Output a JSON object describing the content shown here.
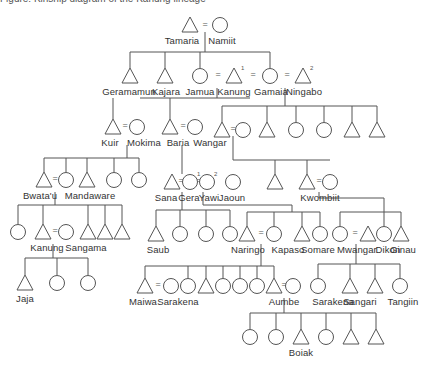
{
  "caption": "Figure: Kinship diagram of the Kanung lineage",
  "legend": {
    "male": "triangle",
    "female": "circle",
    "marriage": "="
  },
  "people": [
    {
      "id": "tamaria",
      "label": "Tamaria",
      "sex": "m",
      "x": 190,
      "y": 25,
      "lx": 182
    },
    {
      "id": "namiit",
      "label": "Namiit",
      "sex": "f",
      "x": 220,
      "y": 25,
      "lx": 222
    },
    {
      "id": "geramamun",
      "label": "Geramamun",
      "sex": "m",
      "x": 130,
      "y": 76,
      "lx": 129
    },
    {
      "id": "kajara",
      "label": "Kajara",
      "sex": "m",
      "x": 165,
      "y": 76,
      "lx": 166
    },
    {
      "id": "jamua",
      "label": "Jamua",
      "sex": "f",
      "x": 200,
      "y": 76,
      "lx": 200
    },
    {
      "id": "kanung",
      "label": "Kanung",
      "sex": "m",
      "x": 234,
      "y": 76,
      "lx": 234,
      "sup": "1"
    },
    {
      "id": "gamaia",
      "label": "Gamaia",
      "sex": "f",
      "x": 270,
      "y": 76,
      "lx": 271
    },
    {
      "id": "ningabo",
      "label": "Ningabo",
      "sex": "m",
      "x": 303,
      "y": 76,
      "lx": 304,
      "sup": "2"
    },
    {
      "id": "kuir",
      "label": "Kuir",
      "sex": "m",
      "x": 113,
      "y": 127,
      "lx": 110
    },
    {
      "id": "mokima",
      "label": "Mokima",
      "sex": "f",
      "x": 137,
      "y": 127,
      "lx": 144
    },
    {
      "id": "baria",
      "label": "Baria",
      "sex": "m",
      "x": 170,
      "y": 127,
      "lx": 178
    },
    {
      "id": "wangar",
      "label": "Wangar",
      "sex": "f",
      "x": 195,
      "y": 127,
      "lx": 210
    },
    {
      "id": "g2a",
      "label": "",
      "sex": "m",
      "x": 222,
      "y": 130
    },
    {
      "id": "g2b",
      "label": "",
      "sex": "f",
      "x": 243,
      "y": 130
    },
    {
      "id": "g2c",
      "label": "",
      "sex": "m",
      "x": 267,
      "y": 130
    },
    {
      "id": "g2d",
      "label": "",
      "sex": "f",
      "x": 296,
      "y": 130
    },
    {
      "id": "g2e",
      "label": "",
      "sex": "f",
      "x": 324,
      "y": 130
    },
    {
      "id": "g2f",
      "label": "",
      "sex": "m",
      "x": 352,
      "y": 130
    },
    {
      "id": "g2g",
      "label": "",
      "sex": "m",
      "x": 377,
      "y": 130
    },
    {
      "id": "bwatau",
      "label": "Bwata'u",
      "sex": "m",
      "x": 44,
      "y": 180,
      "lx": 40
    },
    {
      "id": "mandaware",
      "label": "Mandaware",
      "sex": "f",
      "x": 66,
      "y": 180,
      "lx": 90
    },
    {
      "id": "g3c",
      "label": "",
      "sex": "m",
      "x": 87,
      "y": 180
    },
    {
      "id": "g3d",
      "label": "",
      "sex": "f",
      "x": 114,
      "y": 180
    },
    {
      "id": "g3e",
      "label": "",
      "sex": "f",
      "x": 139,
      "y": 180
    },
    {
      "id": "sana",
      "label": "Sana",
      "sex": "m",
      "x": 172,
      "y": 182,
      "lx": 166
    },
    {
      "id": "gera",
      "label": "Gera",
      "sex": "f",
      "x": 190,
      "y": 182,
      "lx": 189,
      "sup": "1"
    },
    {
      "id": "yawi",
      "label": "Yawi",
      "sex": "f",
      "x": 207,
      "y": 182,
      "lx": 209,
      "sup": "2"
    },
    {
      "id": "jaoun",
      "label": "Jaoun",
      "sex": "f",
      "x": 233,
      "y": 182,
      "lx": 232
    },
    {
      "id": "g3j",
      "label": "",
      "sex": "m",
      "x": 275,
      "y": 182
    },
    {
      "id": "kwombiit",
      "label": "Kwombiit",
      "sex": "m",
      "x": 307,
      "y": 182,
      "lx": 320
    },
    {
      "id": "g3l",
      "label": "",
      "sex": "f",
      "x": 330,
      "y": 182
    },
    {
      "id": "g4a",
      "label": "",
      "sex": "f",
      "x": 18,
      "y": 232
    },
    {
      "id": "kanung2",
      "label": "Kanung",
      "sex": "m",
      "x": 43,
      "y": 232,
      "lx": 47
    },
    {
      "id": "sangama",
      "label": "Sangama",
      "sex": "f",
      "x": 66,
      "y": 232,
      "lx": 86
    },
    {
      "id": "g4d",
      "label": "",
      "sex": "m",
      "x": 88,
      "y": 232
    },
    {
      "id": "g4e",
      "label": "",
      "sex": "m",
      "x": 105,
      "y": 232
    },
    {
      "id": "g4f",
      "label": "",
      "sex": "m",
      "x": 122,
      "y": 232
    },
    {
      "id": "saub",
      "label": "Saub",
      "sex": "m",
      "x": 156,
      "y": 234,
      "lx": 158
    },
    {
      "id": "g4h",
      "label": "",
      "sex": "f",
      "x": 180,
      "y": 234
    },
    {
      "id": "g4i",
      "label": "",
      "sex": "f",
      "x": 206,
      "y": 234
    },
    {
      "id": "g4j",
      "label": "",
      "sex": "f",
      "x": 230,
      "y": 234
    },
    {
      "id": "naringo",
      "label": "Naringo",
      "sex": "m",
      "x": 247,
      "y": 234,
      "lx": 248
    },
    {
      "id": "kapaso",
      "label": "Kapaso",
      "sex": "f",
      "x": 274,
      "y": 234,
      "lx": 288
    },
    {
      "id": "somare",
      "label": "Somare",
      "sex": "m",
      "x": 302,
      "y": 234,
      "lx": 318
    },
    {
      "id": "g4n",
      "label": "",
      "sex": "f",
      "x": 320,
      "y": 234
    },
    {
      "id": "mwangar",
      "label": "Mwangar",
      "sex": "f",
      "x": 340,
      "y": 234,
      "lx": 357
    },
    {
      "id": "dikon",
      "label": "Dikon",
      "sex": "m",
      "x": 368,
      "y": 234,
      "lx": 388
    },
    {
      "id": "g4q",
      "label": "",
      "sex": "f",
      "x": 384,
      "y": 234
    },
    {
      "id": "ginau",
      "label": "Ginau",
      "sex": "m",
      "x": 401,
      "y": 234,
      "lx": 403
    },
    {
      "id": "jaja",
      "label": "Jaja",
      "sex": "m",
      "x": 25,
      "y": 283,
      "lx": 25
    },
    {
      "id": "g5b",
      "label": "",
      "sex": "f",
      "x": 57,
      "y": 283
    },
    {
      "id": "g5c",
      "label": "",
      "sex": "f",
      "x": 88,
      "y": 283
    },
    {
      "id": "maiwa",
      "label": "Maiwa",
      "sex": "m",
      "x": 145,
      "y": 286,
      "lx": 143
    },
    {
      "id": "sarakena1",
      "label": "Sarakena",
      "sex": "f",
      "x": 171,
      "y": 286,
      "lx": 178
    },
    {
      "id": "g5f",
      "label": "",
      "sex": "f",
      "x": 188,
      "y": 286
    },
    {
      "id": "g5g",
      "label": "",
      "sex": "m",
      "x": 206,
      "y": 286
    },
    {
      "id": "g5h",
      "label": "",
      "sex": "f",
      "x": 223,
      "y": 286
    },
    {
      "id": "g5i",
      "label": "",
      "sex": "f",
      "x": 240,
      "y": 286
    },
    {
      "id": "g5j",
      "label": "",
      "sex": "f",
      "x": 257,
      "y": 286
    },
    {
      "id": "aumbe",
      "label": "Aumbe",
      "sex": "m",
      "x": 274,
      "y": 286,
      "lx": 284
    },
    {
      "id": "g5l",
      "label": "",
      "sex": "f",
      "x": 293,
      "y": 286
    },
    {
      "id": "sarakena2",
      "label": "Sarakena",
      "sex": "f",
      "x": 318,
      "y": 286,
      "lx": 333
    },
    {
      "id": "sangari",
      "label": "Sangari",
      "sex": "m",
      "x": 350,
      "y": 286,
      "lx": 360
    },
    {
      "id": "g5o",
      "label": "",
      "sex": "m",
      "x": 375,
      "y": 286
    },
    {
      "id": "tangiin",
      "label": "Tangiin",
      "sex": "f",
      "x": 400,
      "y": 286,
      "lx": 403
    },
    {
      "id": "g6a",
      "label": "",
      "sex": "f",
      "x": 250,
      "y": 337
    },
    {
      "id": "g6b",
      "label": "",
      "sex": "f",
      "x": 276,
      "y": 337
    },
    {
      "id": "boiak",
      "label": "Boiak",
      "sex": "m",
      "x": 301,
      "y": 337,
      "lx": 301
    },
    {
      "id": "g6d",
      "label": "",
      "sex": "f",
      "x": 326,
      "y": 337
    },
    {
      "id": "g6e",
      "label": "",
      "sex": "m",
      "x": 351,
      "y": 337
    },
    {
      "id": "g6f",
      "label": "",
      "sex": "m",
      "x": 376,
      "y": 337
    }
  ],
  "marriages": [
    {
      "x": 205,
      "y": 24
    },
    {
      "x": 218,
      "y": 74
    },
    {
      "x": 253,
      "y": 74
    },
    {
      "x": 287,
      "y": 74
    },
    {
      "x": 125,
      "y": 125
    },
    {
      "x": 183,
      "y": 125
    },
    {
      "x": 233,
      "y": 128
    },
    {
      "x": 55,
      "y": 178
    },
    {
      "x": 181,
      "y": 180
    },
    {
      "x": 198,
      "y": 180
    },
    {
      "x": 319,
      "y": 180
    },
    {
      "x": 55,
      "y": 230
    },
    {
      "x": 261,
      "y": 232
    },
    {
      "x": 355,
      "y": 232
    },
    {
      "x": 158,
      "y": 284
    },
    {
      "x": 284,
      "y": 284
    }
  ],
  "lines": [
    [
      205,
      32,
      205,
      52
    ],
    [
      130,
      52,
      270,
      52
    ],
    [
      130,
      52,
      130,
      68
    ],
    [
      165,
      52,
      165,
      68
    ],
    [
      200,
      52,
      200,
      68
    ],
    [
      270,
      52,
      270,
      68
    ],
    [
      217,
      88,
      217,
      98
    ],
    [
      140,
      98,
      250,
      98
    ],
    [
      113,
      98,
      113,
      119
    ],
    [
      170,
      98,
      170,
      119
    ],
    [
      285,
      88,
      285,
      106
    ],
    [
      222,
      106,
      377,
      106
    ],
    [
      222,
      106,
      222,
      122
    ],
    [
      267,
      106,
      267,
      122
    ],
    [
      296,
      106,
      296,
      122
    ],
    [
      324,
      106,
      324,
      122
    ],
    [
      352,
      106,
      352,
      122
    ],
    [
      377,
      106,
      377,
      122
    ],
    [
      127,
      145,
      127,
      158
    ],
    [
      44,
      158,
      139,
      158
    ],
    [
      44,
      158,
      44,
      172
    ],
    [
      66,
      158,
      66,
      172
    ],
    [
      87,
      158,
      87,
      172
    ],
    [
      114,
      158,
      114,
      172
    ],
    [
      139,
      158,
      139,
      172
    ],
    [
      182,
      145,
      182,
      174
    ],
    [
      233,
      136,
      233,
      160
    ],
    [
      233,
      160,
      330,
      160
    ],
    [
      275,
      160,
      275,
      174
    ],
    [
      307,
      160,
      307,
      174
    ],
    [
      55,
      192,
      55,
      205
    ],
    [
      18,
      205,
      122,
      205
    ],
    [
      18,
      205,
      18,
      224
    ],
    [
      43,
      205,
      43,
      224
    ],
    [
      88,
      205,
      88,
      224
    ],
    [
      105,
      205,
      105,
      224
    ],
    [
      122,
      205,
      122,
      224
    ],
    [
      182,
      192,
      182,
      210
    ],
    [
      156,
      210,
      230,
      210
    ],
    [
      156,
      210,
      156,
      226
    ],
    [
      180,
      210,
      180,
      226
    ],
    [
      206,
      210,
      206,
      226
    ],
    [
      230,
      210,
      230,
      226
    ],
    [
      203,
      192,
      203,
      205
    ],
    [
      203,
      205,
      292,
      205
    ],
    [
      292,
      205,
      292,
      212
    ],
    [
      247,
      212,
      320,
      212
    ],
    [
      247,
      212,
      247,
      226
    ],
    [
      274,
      212,
      274,
      226
    ],
    [
      302,
      212,
      302,
      226
    ],
    [
      320,
      212,
      320,
      226
    ],
    [
      319,
      192,
      319,
      198
    ],
    [
      319,
      198,
      384,
      198
    ],
    [
      384,
      198,
      384,
      226
    ],
    [
      340,
      212,
      401,
      212
    ],
    [
      340,
      212,
      340,
      226
    ],
    [
      401,
      212,
      401,
      226
    ],
    [
      53,
      244,
      53,
      258
    ],
    [
      25,
      258,
      88,
      258
    ],
    [
      25,
      258,
      25,
      275
    ],
    [
      57,
      258,
      57,
      275
    ],
    [
      88,
      258,
      88,
      275
    ],
    [
      261,
      244,
      261,
      266
    ],
    [
      145,
      266,
      274,
      266
    ],
    [
      145,
      266,
      145,
      278
    ],
    [
      188,
      266,
      188,
      278
    ],
    [
      206,
      266,
      206,
      278
    ],
    [
      223,
      266,
      223,
      278
    ],
    [
      240,
      266,
      240,
      278
    ],
    [
      257,
      266,
      257,
      278
    ],
    [
      274,
      266,
      274,
      278
    ],
    [
      356,
      244,
      356,
      264
    ],
    [
      318,
      264,
      400,
      264
    ],
    [
      318,
      264,
      318,
      278
    ],
    [
      350,
      264,
      350,
      278
    ],
    [
      375,
      264,
      375,
      278
    ],
    [
      400,
      264,
      400,
      278
    ],
    [
      284,
      298,
      284,
      313
    ],
    [
      250,
      313,
      376,
      313
    ],
    [
      250,
      313,
      250,
      329
    ],
    [
      276,
      313,
      276,
      329
    ],
    [
      301,
      313,
      301,
      329
    ],
    [
      326,
      313,
      326,
      329
    ],
    [
      351,
      313,
      351,
      329
    ],
    [
      376,
      313,
      376,
      329
    ]
  ]
}
